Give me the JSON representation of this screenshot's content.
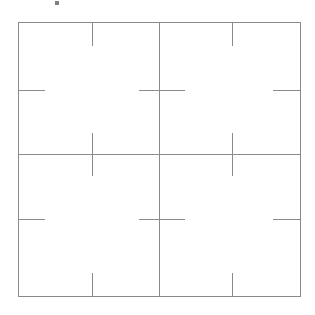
{
  "figure": {
    "canvas": {
      "width": 315,
      "height": 315,
      "background": "#ffffff"
    },
    "colors": {
      "frame_stroke": "#8a8a8a",
      "divider_stroke": "#8a8a8a",
      "tick_stroke": "#8a8a8a",
      "artifact_fill": "#555555"
    },
    "stroke_widths": {
      "frame": 1,
      "divider": 1,
      "tick": 1.4
    },
    "frame": {
      "left": 18,
      "top": 22,
      "right": 300,
      "bottom": 296
    },
    "dividers": [
      {
        "name": "vertical-center-divider",
        "orientation": "vertical",
        "position": 159,
        "from": 22,
        "to": 296
      },
      {
        "name": "horizontal-center-divider",
        "orientation": "horizontal",
        "position": 154,
        "from": 18,
        "to": 300
      }
    ],
    "ticks": [
      {
        "name": "tick-top-left-quadrant",
        "orientation": "vertical",
        "x": 92,
        "y1": 22,
        "y2": 46
      },
      {
        "name": "tick-top-right-quadrant",
        "orientation": "vertical",
        "x": 232,
        "y1": 22,
        "y2": 46
      },
      {
        "name": "tick-left-upper",
        "orientation": "horizontal",
        "y": 90,
        "x1": 18,
        "x2": 45
      },
      {
        "name": "tick-center-upper-cross",
        "orientation": "horizontal",
        "y": 90,
        "x1": 139,
        "x2": 185
      },
      {
        "name": "tick-right-upper",
        "orientation": "horizontal",
        "y": 90,
        "x1": 273,
        "x2": 300
      },
      {
        "name": "tick-midline-left-cross",
        "orientation": "vertical",
        "x": 92,
        "y1": 133,
        "y2": 176
      },
      {
        "name": "tick-midline-right-cross",
        "orientation": "vertical",
        "x": 232,
        "y1": 133,
        "y2": 176
      },
      {
        "name": "tick-left-lower",
        "orientation": "horizontal",
        "y": 219,
        "x1": 18,
        "x2": 45
      },
      {
        "name": "tick-center-lower-cross",
        "orientation": "horizontal",
        "y": 219,
        "x1": 139,
        "x2": 185
      },
      {
        "name": "tick-right-lower",
        "orientation": "horizontal",
        "y": 219,
        "x1": 273,
        "x2": 300
      },
      {
        "name": "tick-bottom-left-quadrant",
        "orientation": "vertical",
        "x": 92,
        "y1": 273,
        "y2": 296
      },
      {
        "name": "tick-bottom-right-quadrant",
        "orientation": "vertical",
        "x": 232,
        "y1": 273,
        "y2": 296
      }
    ],
    "artifact": {
      "name": "page-artifact-mark",
      "x": 55,
      "y": 1,
      "width": 4,
      "height": 4
    }
  }
}
